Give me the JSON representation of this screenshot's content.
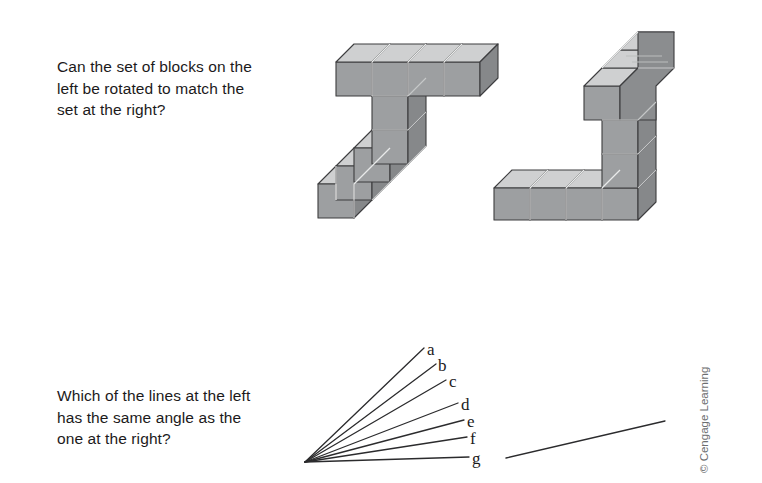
{
  "page": {
    "width": 762,
    "height": 483,
    "background": "#ffffff",
    "text_color": "#1c1a1b"
  },
  "items": [
    {
      "id": "blocks",
      "prompt": "Can the set of blocks on the\nleft be rotated to match the\nset at the right?",
      "figure_kind": "isometric-block-assemblies",
      "figures": [
        {
          "name": "left-block-assembly",
          "description": "T-shaped arrangement of cubes: horizontal row of four cubes across the top, a vertical column of three cubes descending from the second cube, then a row of three cubes extending to the lower left"
        },
        {
          "name": "right-block-assembly",
          "description": "L-shaped arrangement of cubes: vertical column of four cubes at upper right, continuing down three cubes, then a horizontal row of four cubes extending to the lower left"
        }
      ]
    },
    {
      "id": "lines",
      "prompt": "Which of the lines at the left\nhas the same angle as the\none at the right?",
      "figure_kind": "line-angle-fan",
      "fan": {
        "name": "line-fan",
        "origin": {
          "x": 9,
          "y": 126
        },
        "lines": [
          {
            "label": "a",
            "end": {
              "x": 128,
              "y": 12
            },
            "label_pos": {
              "x": 427,
              "y": 341
            }
          },
          {
            "label": "b",
            "end": {
              "x": 140,
              "y": 28
            },
            "label_pos": {
              "x": 438,
              "y": 357
            }
          },
          {
            "label": "c",
            "end": {
              "x": 150,
              "y": 44
            },
            "label_pos": {
              "x": 449,
              "y": 373
            }
          },
          {
            "label": "d",
            "end": {
              "x": 162,
              "y": 67
            },
            "label_pos": {
              "x": 461,
              "y": 396
            }
          },
          {
            "label": "e",
            "end": {
              "x": 168,
              "y": 84
            },
            "label_pos": {
              "x": 467,
              "y": 413
            }
          },
          {
            "label": "f",
            "end": {
              "x": 171,
              "y": 101
            },
            "label_pos": {
              "x": 470,
              "y": 430
            }
          },
          {
            "label": "g",
            "end": {
              "x": 173,
              "y": 121
            },
            "label_pos": {
              "x": 472,
              "y": 450
            }
          }
        ]
      },
      "reference_line": {
        "name": "reference-line",
        "start": {
          "x": 8,
          "y": 46
        },
        "end": {
          "x": 167,
          "y": 9
        }
      }
    }
  ],
  "copyright": {
    "text": "© Cengage Learning",
    "color": "#6d6e70",
    "orientation": "vertical-bottom-to-top"
  },
  "colors": {
    "block_top": "#cfd0d1",
    "block_front": "#9d9fa1",
    "block_side": "#8b8d8f",
    "block_outline": "#3d3d3f",
    "block_seam": "#eeeeee",
    "line_stroke": "#2b2b2d",
    "text": "#1c1a1b",
    "copyright": "#6d6e70"
  }
}
